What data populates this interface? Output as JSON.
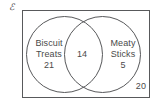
{
  "figure": {
    "universe_symbol": "ℰ",
    "outside_count": "20"
  },
  "chart_data": {
    "type": "venn",
    "title": "",
    "universe_label": "ℰ",
    "sets": [
      {
        "name": "Biscuit Treats",
        "name_line1": "Biscuit",
        "name_line2": "Treats",
        "exclusive_count": 21,
        "exclusive_count_text": "21",
        "position": "left"
      },
      {
        "name": "Meaty Sticks",
        "name_line1": "Meaty",
        "name_line2": "Sticks",
        "exclusive_count": 5,
        "exclusive_count_text": "5",
        "position": "right"
      }
    ],
    "intersection": {
      "label": "Biscuit Treats ∩ Meaty Sticks",
      "count": 14,
      "count_text": "14"
    },
    "outside": {
      "label": "Neither",
      "count": 20,
      "count_text": "20"
    },
    "total": 60,
    "colors": {
      "stroke": "#58595b",
      "text": "#4a4a4a",
      "background": "#ffffff"
    }
  }
}
